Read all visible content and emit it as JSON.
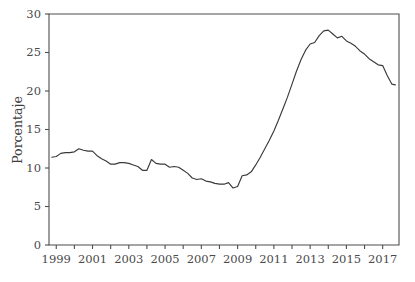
{
  "chart_data": {
    "type": "line",
    "title": "",
    "subtitle": "",
    "xlabel": "",
    "ylabel": "Porcentaje",
    "xlim": [
      1998.6,
      2017.9
    ],
    "ylim": [
      0,
      30
    ],
    "grid": false,
    "legend": null,
    "line_color": "#3a3a3a",
    "axis_color": "#4d4d4d",
    "y_ticks": [
      0,
      5,
      10,
      15,
      20,
      25,
      30
    ],
    "y_tick_labels": [
      "0",
      "5",
      "10",
      "15",
      "20",
      "25",
      "30"
    ],
    "x_ticks": [
      1999,
      2001,
      2003,
      2005,
      2007,
      2009,
      2011,
      2013,
      2015,
      2017
    ],
    "x_tick_labels": [
      "1999",
      "2001",
      "2003",
      "2005",
      "2007",
      "2009",
      "2011",
      "2013",
      "2015",
      "2017"
    ],
    "x_minor_ticks": [
      2000,
      2002,
      2004,
      2006,
      2008,
      2010,
      2012,
      2014,
      2016
    ],
    "series": [
      {
        "name": "Porcentaje",
        "x": [
          1998.75,
          1999.0,
          1999.25,
          1999.5,
          1999.75,
          2000.0,
          2000.25,
          2000.5,
          2000.75,
          2001.0,
          2001.25,
          2001.5,
          2001.75,
          2002.0,
          2002.25,
          2002.5,
          2002.75,
          2003.0,
          2003.25,
          2003.5,
          2003.75,
          2004.0,
          2004.25,
          2004.5,
          2004.75,
          2005.0,
          2005.25,
          2005.5,
          2005.75,
          2006.0,
          2006.25,
          2006.5,
          2006.75,
          2007.0,
          2007.25,
          2007.5,
          2007.75,
          2008.0,
          2008.25,
          2008.5,
          2008.75,
          2009.0,
          2009.25,
          2009.5,
          2009.75,
          2010.0,
          2010.25,
          2010.5,
          2010.75,
          2011.0,
          2011.25,
          2011.5,
          2011.75,
          2012.0,
          2012.25,
          2012.5,
          2012.75,
          2013.0,
          2013.25,
          2013.5,
          2013.75,
          2014.0,
          2014.25,
          2014.5,
          2014.75,
          2015.0,
          2015.25,
          2015.5,
          2015.75,
          2016.0,
          2016.25,
          2016.5,
          2016.75,
          2017.0,
          2017.25,
          2017.5,
          2017.7
        ],
        "values": [
          11.4,
          11.5,
          11.9,
          12.0,
          12.0,
          12.1,
          12.5,
          12.3,
          12.2,
          12.2,
          11.6,
          11.2,
          10.9,
          10.5,
          10.5,
          10.7,
          10.7,
          10.6,
          10.4,
          10.2,
          9.7,
          9.7,
          11.1,
          10.6,
          10.5,
          10.5,
          10.1,
          10.2,
          10.1,
          9.7,
          9.3,
          8.7,
          8.5,
          8.6,
          8.3,
          8.2,
          8.0,
          7.9,
          7.9,
          8.1,
          7.4,
          7.6,
          9.0,
          9.1,
          9.5,
          10.4,
          11.4,
          12.5,
          13.6,
          14.8,
          16.2,
          17.7,
          19.2,
          20.9,
          22.6,
          24.1,
          25.3,
          26.1,
          26.3,
          27.2,
          27.8,
          27.9,
          27.4,
          26.9,
          27.1,
          26.5,
          26.2,
          25.8,
          25.2,
          24.8,
          24.2,
          23.8,
          23.4,
          23.3,
          22.0,
          20.9,
          20.8
        ]
      }
    ]
  }
}
